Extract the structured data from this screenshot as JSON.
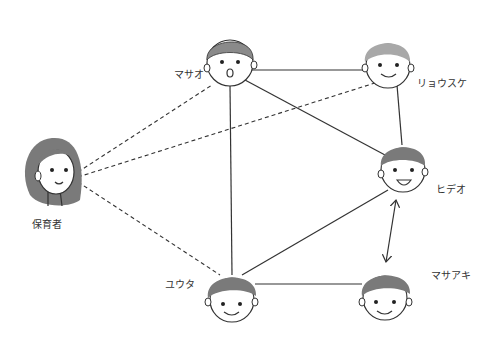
{
  "diagram": {
    "type": "sociogram",
    "nodes": [
      {
        "id": "caregiver",
        "label": "保育者"
      },
      {
        "id": "masao",
        "label": "マサオ"
      },
      {
        "id": "ryosuke",
        "label": "リョウスケ"
      },
      {
        "id": "hideo",
        "label": "ヒデオ"
      },
      {
        "id": "yuta",
        "label": "ユウタ"
      },
      {
        "id": "masaaki",
        "label": "マサアキ"
      }
    ],
    "edges": [
      {
        "from": "masao",
        "to": "ryosuke",
        "style": "solid"
      },
      {
        "from": "masao",
        "to": "hideo",
        "style": "solid"
      },
      {
        "from": "masao",
        "to": "yuta",
        "style": "solid"
      },
      {
        "from": "ryosuke",
        "to": "hideo",
        "style": "solid"
      },
      {
        "from": "hideo",
        "to": "yuta",
        "style": "solid"
      },
      {
        "from": "yuta",
        "to": "masaaki",
        "style": "solid"
      },
      {
        "from": "hideo",
        "to": "masaaki",
        "style": "double-arrow"
      },
      {
        "from": "caregiver",
        "to": "masao",
        "style": "dashed"
      },
      {
        "from": "caregiver",
        "to": "ryosuke",
        "style": "dashed"
      },
      {
        "from": "caregiver",
        "to": "yuta",
        "style": "dashed"
      }
    ],
    "colors": {
      "line": "#333333",
      "hair": "#8a8a8a",
      "face": "#ffffff"
    }
  }
}
